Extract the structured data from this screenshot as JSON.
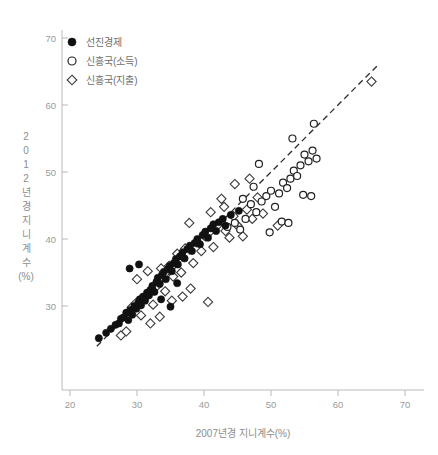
{
  "chart_data": {
    "type": "scatter",
    "title": "",
    "xlabel": "2007년경 지니계수(%)",
    "ylabel": "2012년경 지니계수(%)",
    "xlim": [
      18,
      72
    ],
    "ylim": [
      23,
      72
    ],
    "xticks": [
      20,
      30,
      40,
      50,
      60,
      70
    ],
    "yticks": [
      30,
      40,
      50,
      60,
      70
    ],
    "grid": false,
    "legend_position": "top-left",
    "reference_line": {
      "label": "45-degree identity line",
      "style": "dashed",
      "x": [
        24,
        66
      ],
      "y": [
        24,
        66
      ]
    },
    "series": [
      {
        "name": "선진경제",
        "marker": "filled-circle",
        "color": "#111111",
        "points": [
          [
            24.3,
            25.2
          ],
          [
            25.4,
            26.0
          ],
          [
            26.1,
            26.6
          ],
          [
            26.8,
            27.2
          ],
          [
            27.3,
            27.4
          ],
          [
            27.6,
            28.1
          ],
          [
            28.0,
            28.3
          ],
          [
            28.4,
            29.0
          ],
          [
            28.7,
            27.9
          ],
          [
            29.0,
            29.4
          ],
          [
            29.3,
            28.7
          ],
          [
            29.6,
            30.0
          ],
          [
            29.9,
            29.6
          ],
          [
            30.2,
            30.5
          ],
          [
            30.4,
            31.0
          ],
          [
            30.6,
            30.1
          ],
          [
            30.9,
            31.4
          ],
          [
            31.2,
            30.8
          ],
          [
            31.5,
            32.0
          ],
          [
            31.8,
            31.6
          ],
          [
            32.0,
            32.4
          ],
          [
            32.3,
            33.0
          ],
          [
            32.6,
            32.1
          ],
          [
            32.9,
            33.6
          ],
          [
            33.1,
            34.2
          ],
          [
            33.4,
            33.3
          ],
          [
            33.7,
            34.6
          ],
          [
            34.0,
            35.1
          ],
          [
            34.3,
            34.0
          ],
          [
            34.6,
            35.5
          ],
          [
            34.9,
            36.0
          ],
          [
            35.2,
            35.2
          ],
          [
            35.5,
            36.4
          ],
          [
            35.8,
            37.0
          ],
          [
            36.1,
            36.2
          ],
          [
            36.4,
            37.4
          ],
          [
            36.8,
            38.0
          ],
          [
            37.1,
            37.1
          ],
          [
            37.5,
            38.5
          ],
          [
            37.9,
            39.0
          ],
          [
            38.2,
            38.2
          ],
          [
            38.6,
            39.4
          ],
          [
            39.0,
            40.0
          ],
          [
            39.4,
            39.2
          ],
          [
            39.8,
            40.6
          ],
          [
            40.2,
            41.1
          ],
          [
            40.6,
            40.2
          ],
          [
            41.0,
            41.6
          ],
          [
            41.4,
            42.2
          ],
          [
            41.8,
            41.2
          ],
          [
            42.2,
            42.5
          ],
          [
            28.9,
            35.6
          ],
          [
            30.3,
            36.2
          ],
          [
            33.6,
            31.0
          ],
          [
            35.0,
            29.9
          ],
          [
            36.0,
            33.4
          ],
          [
            42.8,
            43.0
          ],
          [
            43.2,
            42.0
          ],
          [
            44.0,
            43.6
          ],
          [
            45.2,
            44.2
          ]
        ]
      },
      {
        "name": "신흥국(소득)",
        "marker": "open-circle",
        "color": "#222222",
        "points": [
          [
            43.5,
            41.8
          ],
          [
            44.6,
            42.4
          ],
          [
            45.4,
            41.4
          ],
          [
            46.2,
            43.0
          ],
          [
            47.0,
            45.2
          ],
          [
            47.8,
            44.0
          ],
          [
            48.6,
            45.6
          ],
          [
            49.3,
            46.4
          ],
          [
            50.0,
            47.2
          ],
          [
            50.6,
            44.8
          ],
          [
            51.2,
            46.8
          ],
          [
            51.8,
            48.4
          ],
          [
            52.4,
            47.6
          ],
          [
            52.9,
            49.0
          ],
          [
            53.4,
            50.2
          ],
          [
            53.9,
            49.4
          ],
          [
            54.4,
            51.0
          ],
          [
            55.0,
            52.6
          ],
          [
            55.6,
            51.6
          ],
          [
            56.2,
            53.2
          ],
          [
            56.8,
            52.0
          ],
          [
            49.8,
            41.0
          ],
          [
            51.6,
            42.6
          ],
          [
            52.6,
            42.4
          ],
          [
            54.8,
            46.6
          ],
          [
            56.0,
            46.4
          ],
          [
            48.2,
            51.2
          ],
          [
            53.2,
            55.0
          ],
          [
            56.4,
            57.2
          ],
          [
            47.4,
            47.8
          ],
          [
            45.8,
            46.0
          ]
        ]
      },
      {
        "name": "신흥국(지출)",
        "marker": "open-diamond",
        "color": "#3a3a3a",
        "points": [
          [
            27.6,
            25.6
          ],
          [
            28.4,
            26.2
          ],
          [
            29.2,
            29.8
          ],
          [
            29.8,
            30.4
          ],
          [
            30.6,
            28.6
          ],
          [
            31.2,
            31.2
          ],
          [
            31.8,
            32.0
          ],
          [
            32.4,
            30.2
          ],
          [
            33.0,
            33.0
          ],
          [
            33.6,
            35.6
          ],
          [
            34.2,
            32.2
          ],
          [
            34.8,
            36.0
          ],
          [
            35.4,
            34.4
          ],
          [
            36.0,
            37.8
          ],
          [
            36.6,
            35.0
          ],
          [
            37.2,
            38.6
          ],
          [
            37.8,
            42.4
          ],
          [
            38.4,
            36.4
          ],
          [
            39.0,
            39.6
          ],
          [
            39.6,
            38.2
          ],
          [
            40.2,
            40.4
          ],
          [
            40.8,
            41.0
          ],
          [
            41.4,
            38.8
          ],
          [
            42.0,
            42.0
          ],
          [
            42.6,
            46.0
          ],
          [
            43.2,
            41.2
          ],
          [
            43.8,
            40.2
          ],
          [
            44.4,
            43.4
          ],
          [
            45.0,
            42.0
          ],
          [
            45.8,
            40.4
          ],
          [
            46.4,
            44.4
          ],
          [
            47.2,
            43.0
          ],
          [
            48.0,
            46.2
          ],
          [
            48.8,
            43.8
          ],
          [
            38.0,
            32.6
          ],
          [
            40.6,
            30.6
          ],
          [
            35.2,
            30.8
          ],
          [
            36.8,
            31.4
          ],
          [
            32.0,
            27.4
          ],
          [
            33.4,
            28.4
          ],
          [
            44.6,
            48.2
          ],
          [
            46.8,
            49.0
          ],
          [
            51.0,
            42.0
          ],
          [
            65.0,
            63.5
          ],
          [
            30.0,
            34.0
          ],
          [
            31.6,
            35.2
          ],
          [
            43.0,
            44.8
          ],
          [
            41.0,
            44.0
          ]
        ]
      }
    ]
  },
  "axes": {
    "x_tick_labels": [
      "20",
      "30",
      "40",
      "50",
      "60",
      "70"
    ],
    "y_tick_labels": [
      "70",
      "60",
      "50",
      "40",
      "30"
    ],
    "x_title": "2007년경 지니계수(%)",
    "y_title_chars": [
      "2",
      "0",
      "1",
      "2",
      "년",
      "경",
      "지",
      "니",
      "계",
      "수",
      "(%)"
    ]
  },
  "legend": {
    "items": [
      {
        "label": "선진경제",
        "marker": "filled-circle"
      },
      {
        "label": "신흥국(소득)",
        "marker": "open-circle"
      },
      {
        "label": "신흥국(지출)",
        "marker": "open-diamond"
      }
    ]
  }
}
